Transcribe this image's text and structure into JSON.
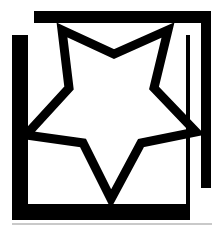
{
  "image": {
    "title": "Star in layered square frames",
    "width": 222,
    "height": 226,
    "background_color": "#ffffff"
  },
  "palette": {
    "ink": "#000000",
    "paper": "#ffffff",
    "hairline": "#c9c9c9",
    "edge_shadow": "#9a9a9a"
  },
  "layers": {
    "back_frame": {
      "name": "back-square-frame",
      "shape": "square-outline",
      "color": "#000000",
      "x": 34,
      "y": 11,
      "width": 177,
      "height": 177,
      "stroke_width": 16
    },
    "front_frame": {
      "name": "front-square-frame",
      "shape": "square-outline",
      "color": "#000000",
      "x": 12,
      "y": 35,
      "width": 178,
      "height": 185,
      "stroke_width": 16
    },
    "paper_card": {
      "name": "white-paper-card",
      "shape": "rectangle",
      "color": "#ffffff",
      "x": 24,
      "y": 23,
      "width": 177,
      "height": 182
    },
    "baseline_rule": {
      "name": "bottom-hairline-rule",
      "color": "#c9c9c9",
      "x": 12,
      "y": 223,
      "width": 200,
      "height": 2
    }
  },
  "star": {
    "name": "five-pointed-star-outline",
    "points": 5,
    "fill": "none",
    "stroke_color": "#000000",
    "stroke_width": 9,
    "center_x": 111,
    "center_y": 114,
    "outer_radius": 88,
    "inner_radius": 41,
    "rotation_degrees": -90,
    "vertices": [
      [
        62,
        30
      ],
      [
        114,
        54
      ],
      [
        168,
        30
      ],
      [
        154,
        88
      ],
      [
        196,
        132
      ],
      [
        141,
        143
      ],
      [
        111,
        199
      ],
      [
        83,
        143
      ],
      [
        26,
        135
      ],
      [
        69,
        88
      ]
    ]
  }
}
